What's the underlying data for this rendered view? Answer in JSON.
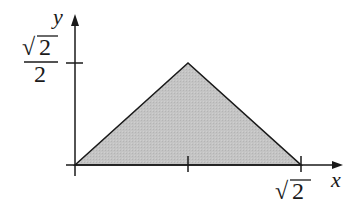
{
  "diagram": {
    "type": "triangle-region-plot",
    "axes": {
      "x_label": "x",
      "y_label": "y"
    },
    "ticks": {
      "y_tick_label": {
        "numerator": "2",
        "radical": "√",
        "denominator": "2"
      },
      "x_tick_label": {
        "radical": "√",
        "value": "2"
      }
    },
    "region": {
      "vertices": [
        [
          "0",
          "0"
        ],
        [
          "√2/2",
          "√2/2"
        ],
        [
          "√2",
          "0"
        ]
      ],
      "fill": "#bdbdbd",
      "stroke": "#1a1a1a"
    }
  }
}
